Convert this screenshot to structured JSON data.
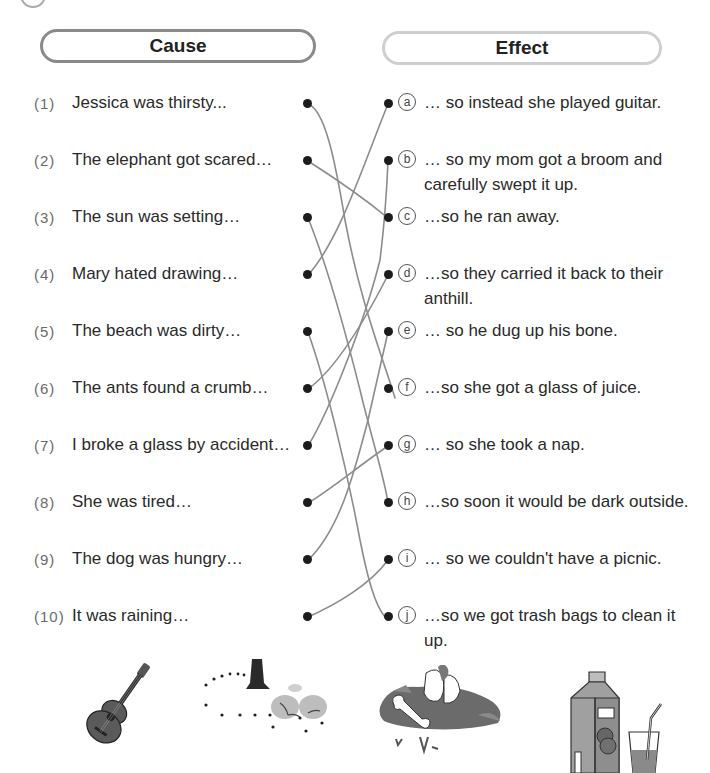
{
  "headers": {
    "cause": "Cause",
    "effect": "Effect"
  },
  "causes": [
    {
      "num": "(1)",
      "text": "Jessica was thirsty..."
    },
    {
      "num": "(2)",
      "text": "The elephant got scared…"
    },
    {
      "num": "(3)",
      "text": "The sun was setting…"
    },
    {
      "num": "(4)",
      "text": "Mary hated drawing…"
    },
    {
      "num": "(5)",
      "text": "The beach was dirty…"
    },
    {
      "num": "(6)",
      "text": "The ants found a crumb…"
    },
    {
      "num": "(7)",
      "text": "I broke a glass by accident…"
    },
    {
      "num": "(8)",
      "text": "She was tired…"
    },
    {
      "num": "(9)",
      "text": "The dog was hungry…"
    },
    {
      "num": "(10)",
      "text": "It was raining…"
    }
  ],
  "effects": [
    {
      "letter": "a",
      "text": "… so instead she played guitar."
    },
    {
      "letter": "b",
      "text": "… so my mom got a broom and carefully swept it up."
    },
    {
      "letter": "c",
      "text": "…so he ran away."
    },
    {
      "letter": "d",
      "text": "…so they carried it back to their anthill."
    },
    {
      "letter": "e",
      "text": "… so he dug up his bone."
    },
    {
      "letter": "f",
      "text": "…so she got a glass of juice."
    },
    {
      "letter": "g",
      "text": "… so she took a nap."
    },
    {
      "letter": "h",
      "text": "…so soon it would be dark outside."
    },
    {
      "letter": "i",
      "text": "… so we couldn't have a picnic."
    },
    {
      "letter": "j",
      "text": "…so we got trash bags to clean it up."
    }
  ],
  "matches": [
    {
      "cause": "1",
      "effect": "f"
    },
    {
      "cause": "2",
      "effect": "c"
    },
    {
      "cause": "3",
      "effect": "h"
    },
    {
      "cause": "4",
      "effect": "a"
    },
    {
      "cause": "5",
      "effect": "j"
    },
    {
      "cause": "6",
      "effect": "d"
    },
    {
      "cause": "7",
      "effect": "b"
    },
    {
      "cause": "8",
      "effect": "g"
    },
    {
      "cause": "9",
      "effect": "e"
    },
    {
      "cause": "10",
      "effect": "i"
    }
  ],
  "illustrations": [
    {
      "name": "guitar-illustration"
    },
    {
      "name": "ants-and-crumb-illustration"
    },
    {
      "name": "dog-digging-bone-illustration"
    },
    {
      "name": "juice-carton-and-glass-illustration"
    }
  ],
  "colors": {
    "line": "#8c8c8c",
    "dot": "#1c1c1c",
    "cause_border": "#8a8a8a",
    "effect_border": "#cfcfcf"
  }
}
